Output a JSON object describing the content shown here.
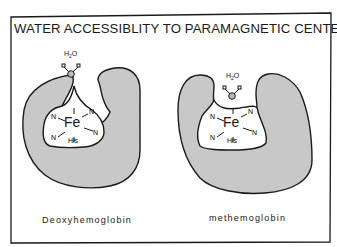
{
  "title": "WATER ACCESSIBLITY TO PARAMAGNETIC CENTER",
  "panels": [
    {
      "caption": "Deoxyhemoglobin",
      "metal": "Fe",
      "axial_ligand": "His",
      "equatorial_ligands": [
        "N",
        "N",
        "N",
        "N"
      ],
      "water_label_main": "H",
      "water_label_sub": "2",
      "water_label_end": "O"
    },
    {
      "caption": "methemoglobin",
      "metal": "Fe",
      "axial_ligand": "His",
      "equatorial_ligands": [
        "N",
        "N",
        "N",
        "N"
      ],
      "water_label_main": "H",
      "water_label_sub": "2",
      "water_label_end": "O"
    }
  ],
  "colors": {
    "protein_fill": "#c8c8c8",
    "outline": "#1a1a1a",
    "background": "#ffffff"
  }
}
